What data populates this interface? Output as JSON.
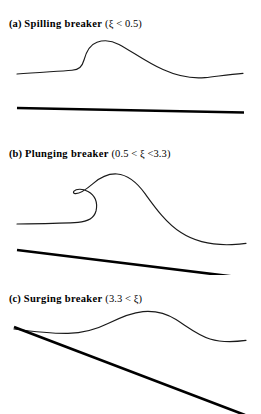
{
  "figure": {
    "line_color": "#1a1a1a",
    "bed_color": "#000000",
    "background": "#ffffff"
  },
  "panels": [
    {
      "id": "a",
      "lead": "(a)",
      "name": "Spilling breaker",
      "range_open": "(",
      "symbol": "ξ",
      "relation": " < ",
      "value": "0.5",
      "range_close": ")",
      "range_text": "(ξ < 0.5)",
      "caption": "(a) Spilling breaker (ξ < 0.5)",
      "bed_slope_label": "nearly horizontal",
      "surface_shape": "gentle asymmetric crest with steep front face",
      "surface_path": "M 17,44 C 38,42.2 58,41.4 72,40.2 C 79,39.6 82,37 84,30 C 86,22.5 90,14.6 97,12.2 C 104,9.8 112,10.6 119,14.4 C 132,21.4 146,32 163,39.6 C 178,46.4 192,48.8 205,47.6 C 216,46.6 228,44.4 243,43.4",
      "bed_path": "M 17,78 L 244,82.5"
    },
    {
      "id": "b",
      "lead": "(b)",
      "name": "Plunging breaker",
      "range_open": "(",
      "symbol": "ξ",
      "relation": " < ",
      "value_low": "0.5",
      "value_high": "3.3",
      "range_text": "(0.5 < ξ <3.3)",
      "caption": "(b) Plunging breaker (0.5 < ξ <3.3)",
      "bed_slope_label": "moderate slope",
      "surface_shape": "overturning crest curling forward into a hook",
      "surface_path": "M 17,72 C 42,71.6 64,71.4 78,70.4 C 88,69.6 94,66.6 96,59 C 98,50.4 95,43 88,39.4 C 82,36.2 76,37 74,39.2 C 73,40.3 73.4,41.4 75,41.6 C 80,42.2 86,37.6 93,31.6 C 100,25.6 108,21.4 117,22 C 128,22.8 137,30.6 145,41.6 C 155,55.4 166,71 181,80.6 C 196,90.4 213,93.4 232,92.6 C 238,92.3 243,91.8 246,91.4",
      "bed_path": "M 17,98 L 245,126"
    },
    {
      "id": "c",
      "lead": "(c)",
      "name": "Surging breaker",
      "range_open": "(",
      "symbol": "ξ",
      "relation": " < ",
      "value": "3.3",
      "range_close": ")",
      "range_text": "(3.3 < ξ)",
      "caption": "(c) Surging breaker (3.3 < ξ)",
      "bed_slope_label": "steep slope intersecting the water surface",
      "surface_shape": "low broad swell riding up the steep slope",
      "surface_path": "M 14,32 C 32,34.4 52,36.6 68,36.4 C 84,36.2 96,32.6 108,26.6 C 120,20.6 131,15.6 143,14.6 C 155,13.6 166,16.2 176,22.6 C 188,30.2 198,38.4 210,42 C 222,45.6 234,45 246,43.4",
      "bed_path": "M 14,30 L 245,118"
    }
  ]
}
